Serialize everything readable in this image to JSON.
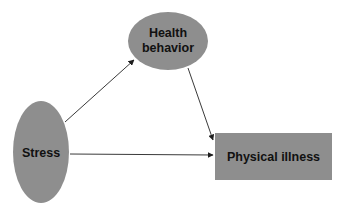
{
  "diagram": {
    "type": "path-model",
    "background_color": "#ffffff",
    "node_color": "#8e8e8e",
    "edge_color": "#3a3a3a",
    "nodes": [
      {
        "id": "stress",
        "shape": "ellipse",
        "label": "Stress",
        "cx": 41,
        "cy": 152,
        "rx": 28,
        "ry": 51
      },
      {
        "id": "health_behavior",
        "shape": "ellipse",
        "label_line1": "Health",
        "label_line2": "behavior",
        "cx": 168,
        "cy": 41,
        "rx": 40,
        "ry": 29
      },
      {
        "id": "physical_illness",
        "shape": "rectangle",
        "label": "Physical illness",
        "x": 215,
        "y": 133,
        "width": 117,
        "height": 47
      }
    ],
    "edges": [
      {
        "from": "stress",
        "to": "health_behavior"
      },
      {
        "from": "health_behavior",
        "to": "physical_illness"
      },
      {
        "from": "stress",
        "to": "physical_illness"
      }
    ]
  }
}
